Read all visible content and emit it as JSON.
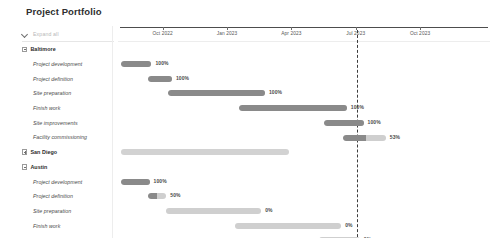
{
  "header": {
    "title": "Project Portfolio"
  },
  "toolbar": {
    "expand_all_label": "Expand all",
    "chevron_icon": "chevron-down-icon"
  },
  "timeline": {
    "ticks": [
      {
        "label": "Oct 2022",
        "x_pct": 12.0
      },
      {
        "label": "Jan 2023",
        "x_pct": 29.3
      },
      {
        "label": "Apr 2023",
        "x_pct": 46.6
      },
      {
        "label": "Jul 2023",
        "x_pct": 63.9
      },
      {
        "label": "Oct 2023",
        "x_pct": 81.2
      }
    ],
    "today_marker_x_pct": 64.3,
    "today_marker_style": "dashed"
  },
  "colors": {
    "bar_complete": "#8a8a8a",
    "bar_incomplete": "#cfcfcf",
    "bar_summary": "#d2d2d2",
    "today_line": "#3d3d3d",
    "text": "#3a3a3a"
  },
  "chart_data": {
    "type": "bar",
    "title": "Project Portfolio",
    "xlabel": "",
    "ylabel": "",
    "rows": [
      {
        "label": "Baltimore",
        "type": "group",
        "expanded": true,
        "indent": 0,
        "bar": null
      },
      {
        "label": "Project development",
        "type": "task",
        "indent": 1,
        "bar": {
          "start_pct": 0.8,
          "end_pct": 9.0,
          "progress": 100,
          "pct_label": "100%"
        }
      },
      {
        "label": "Project definition",
        "type": "task",
        "indent": 1,
        "bar": {
          "start_pct": 8.0,
          "end_pct": 14.5,
          "progress": 100,
          "pct_label": "100%"
        }
      },
      {
        "label": "Site preparation",
        "type": "task",
        "indent": 1,
        "bar": {
          "start_pct": 13.5,
          "end_pct": 39.5,
          "progress": 100,
          "pct_label": "100%"
        }
      },
      {
        "label": "Finish work",
        "type": "task",
        "indent": 1,
        "bar": {
          "start_pct": 32.5,
          "end_pct": 61.5,
          "progress": 100,
          "pct_label": "100%"
        }
      },
      {
        "label": "Site improvements",
        "type": "task",
        "indent": 1,
        "bar": {
          "start_pct": 55.5,
          "end_pct": 66.0,
          "progress": 100,
          "pct_label": "100%"
        }
      },
      {
        "label": "Facility commissioning",
        "type": "task",
        "indent": 1,
        "bar": {
          "start_pct": 60.5,
          "end_pct": 72.0,
          "progress": 53,
          "pct_label": "53%"
        }
      },
      {
        "label": "San Diego",
        "type": "group",
        "expanded": false,
        "indent": 0,
        "bar": {
          "start_pct": 0.8,
          "end_pct": 46.0,
          "progress": 0,
          "pct_label": "",
          "summary": true
        }
      },
      {
        "label": "Austin",
        "type": "group",
        "expanded": true,
        "indent": 0,
        "bar": null
      },
      {
        "label": "Project development",
        "type": "task",
        "indent": 1,
        "bar": {
          "start_pct": 0.8,
          "end_pct": 8.5,
          "progress": 100,
          "pct_label": "100%"
        }
      },
      {
        "label": "Project definition",
        "type": "task",
        "indent": 1,
        "bar": {
          "start_pct": 8.0,
          "end_pct": 13.0,
          "progress": 50,
          "pct_label": "50%"
        }
      },
      {
        "label": "Site preparation",
        "type": "task",
        "indent": 1,
        "bar": {
          "start_pct": 13.0,
          "end_pct": 38.5,
          "progress": 0,
          "pct_label": "0%"
        }
      },
      {
        "label": "Finish work",
        "type": "task",
        "indent": 1,
        "bar": {
          "start_pct": 31.5,
          "end_pct": 60.0,
          "progress": 0,
          "pct_label": "0%"
        }
      },
      {
        "label": "Site improvements",
        "type": "task",
        "indent": 1,
        "bar": {
          "start_pct": 54.0,
          "end_pct": 65.0,
          "progress": 0,
          "pct_label": "0%"
        }
      },
      {
        "label": "Facility commissioning",
        "type": "task",
        "indent": 1,
        "bar": {
          "start_pct": 60.0,
          "end_pct": 100.0,
          "progress": 0,
          "pct_label": ""
        }
      },
      {
        "label": "Atlanta",
        "type": "group",
        "expanded": false,
        "indent": 0,
        "bar": {
          "start_pct": 31.0,
          "end_pct": 75.0,
          "progress": 0,
          "pct_label": "",
          "summary": true
        }
      }
    ]
  }
}
